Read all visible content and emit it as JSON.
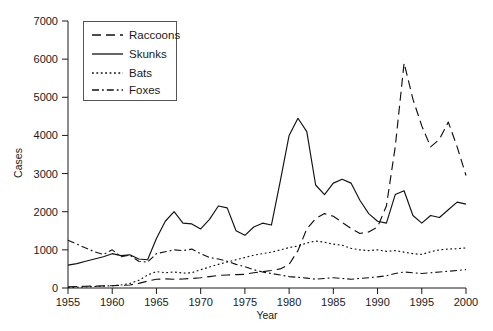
{
  "figure": {
    "background": "#ffffff",
    "line_color": "#111111"
  },
  "chart_data": {
    "type": "line",
    "title": "",
    "xlabel": "Year",
    "ylabel": "Cases",
    "xlim": [
      1955,
      2000
    ],
    "ylim": [
      0,
      7000
    ],
    "xticks": [
      "1955",
      "1960",
      "1965",
      "1970",
      "1975",
      "1980",
      "1985",
      "1990",
      "1995",
      "2000"
    ],
    "yticks": [
      "0",
      "1000",
      "2000",
      "3000",
      "4000",
      "5000",
      "6000",
      "7000"
    ],
    "grid": false,
    "legend_position": "upper-left",
    "x": [
      1955,
      1956,
      1957,
      1958,
      1959,
      1960,
      1961,
      1962,
      1963,
      1964,
      1965,
      1966,
      1967,
      1968,
      1969,
      1970,
      1971,
      1972,
      1973,
      1974,
      1975,
      1976,
      1977,
      1978,
      1979,
      1980,
      1981,
      1982,
      1983,
      1984,
      1985,
      1986,
      1987,
      1988,
      1989,
      1990,
      1991,
      1992,
      1993,
      1994,
      1995,
      1996,
      1997,
      1998,
      1999,
      2000
    ],
    "series": [
      {
        "name": "Raccoons",
        "dash": "9,5",
        "values": [
          30,
          40,
          45,
          50,
          55,
          60,
          70,
          80,
          120,
          180,
          230,
          240,
          230,
          235,
          250,
          270,
          300,
          330,
          340,
          350,
          360,
          400,
          430,
          460,
          500,
          620,
          980,
          1550,
          1820,
          1950,
          1880,
          1720,
          1560,
          1430,
          1470,
          1600,
          2150,
          3700,
          5900,
          4950,
          4250,
          3700,
          3900,
          4350,
          3700,
          2950
        ]
      },
      {
        "name": "Skunks",
        "dash": "none",
        "values": [
          600,
          640,
          700,
          760,
          820,
          900,
          850,
          870,
          760,
          740,
          1300,
          1750,
          2000,
          1700,
          1680,
          1550,
          1800,
          2150,
          2100,
          1500,
          1380,
          1600,
          1700,
          1650,
          2800,
          4000,
          4450,
          4100,
          2700,
          2450,
          2750,
          2850,
          2750,
          2300,
          1950,
          1750,
          1700,
          2450,
          2550,
          1900,
          1700,
          1900,
          1850,
          2050,
          2250,
          2200
        ]
      },
      {
        "name": "Bats",
        "dash": "1.8,2.6",
        "values": [
          10,
          20,
          30,
          40,
          50,
          60,
          80,
          120,
          200,
          340,
          430,
          400,
          420,
          390,
          400,
          480,
          550,
          620,
          680,
          740,
          800,
          860,
          900,
          940,
          1000,
          1060,
          1100,
          1180,
          1230,
          1200,
          1150,
          1120,
          1040,
          1000,
          980,
          1000,
          960,
          980,
          940,
          900,
          880,
          950,
          1000,
          1020,
          1030,
          1050
        ]
      },
      {
        "name": "Foxes",
        "dash": "7,3,1.8,3",
        "values": [
          1250,
          1150,
          1050,
          950,
          880,
          1000,
          820,
          860,
          700,
          680,
          900,
          950,
          1000,
          980,
          1020,
          900,
          800,
          760,
          700,
          620,
          560,
          480,
          420,
          380,
          340,
          300,
          280,
          260,
          230,
          250,
          270,
          250,
          230,
          250,
          270,
          290,
          320,
          380,
          420,
          400,
          380,
          400,
          420,
          440,
          460,
          480
        ]
      }
    ]
  },
  "legend": {
    "entries": [
      {
        "label": "Raccoons"
      },
      {
        "label": "Skunks"
      },
      {
        "label": "Bats"
      },
      {
        "label": "Foxes"
      }
    ]
  }
}
